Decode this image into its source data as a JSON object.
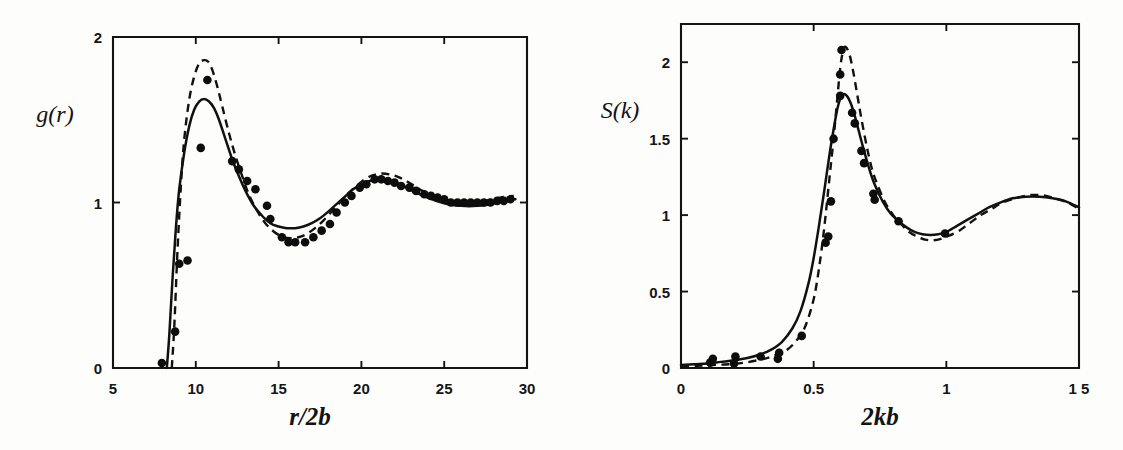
{
  "figure": {
    "background_color": "#fdfdfc",
    "ink_color": "#111111",
    "panels": [
      "left",
      "right"
    ]
  },
  "chart_data": [
    {
      "id": "left",
      "type": "line",
      "title": "",
      "xlabel": "r/2b",
      "ylabel": "g(r)",
      "xlim": [
        5,
        30
      ],
      "ylim": [
        0,
        2
      ],
      "xticks": [
        5,
        10,
        15,
        20,
        25,
        30
      ],
      "xtick_labels": [
        "5",
        "10",
        "15",
        "20",
        "25",
        "30"
      ],
      "yticks": [
        0,
        1,
        2
      ],
      "ytick_labels": [
        "0",
        "1",
        "2"
      ],
      "grid": false,
      "legend": "none",
      "series": [
        {
          "name": "solid curve",
          "style": "solid",
          "x": [
            8.25,
            8.4,
            8.6,
            8.8,
            9.0,
            9.3,
            9.6,
            9.9,
            10.2,
            10.5,
            10.8,
            11.1,
            11.4,
            11.8,
            12.2,
            12.6,
            13.0,
            13.5,
            14.0,
            14.5,
            15.0,
            15.5,
            16.0,
            16.5,
            17.0,
            17.5,
            18.0,
            18.5,
            19.0,
            19.5,
            20.0,
            20.5,
            21.0,
            21.5,
            22.0,
            22.5,
            23.0,
            23.5,
            24.0,
            24.5,
            25.0,
            25.5,
            26.0,
            26.5,
            27.0,
            27.5,
            28.0,
            28.5,
            29.0,
            29.3
          ],
          "y": [
            0.0,
            0.2,
            0.55,
            0.85,
            1.08,
            1.3,
            1.46,
            1.56,
            1.61,
            1.625,
            1.61,
            1.57,
            1.5,
            1.38,
            1.26,
            1.16,
            1.07,
            0.98,
            0.92,
            0.875,
            0.855,
            0.845,
            0.845,
            0.855,
            0.875,
            0.905,
            0.945,
            0.99,
            1.035,
            1.08,
            1.11,
            1.13,
            1.14,
            1.135,
            1.12,
            1.1,
            1.075,
            1.05,
            1.03,
            1.01,
            0.995,
            0.985,
            0.98,
            0.978,
            0.98,
            0.985,
            0.995,
            1.005,
            1.015,
            1.02
          ]
        },
        {
          "name": "dashed curve",
          "style": "dashed",
          "x": [
            8.55,
            8.7,
            8.9,
            9.1,
            9.3,
            9.6,
            9.9,
            10.2,
            10.5,
            10.75,
            11.0,
            11.3,
            11.6,
            12.0,
            12.4,
            12.8,
            13.2,
            13.7,
            14.2,
            14.7,
            15.2,
            15.7,
            16.2,
            16.7,
            17.2,
            17.7,
            18.2,
            18.7,
            19.2,
            19.7,
            20.2,
            20.7,
            21.2,
            21.7,
            22.2,
            22.7,
            23.2,
            23.7,
            24.2,
            24.7,
            25.2,
            25.7,
            26.2,
            26.7,
            27.2,
            27.7,
            28.2,
            28.7,
            29.2
          ],
          "y": [
            0.0,
            0.25,
            0.72,
            1.1,
            1.38,
            1.62,
            1.76,
            1.84,
            1.86,
            1.85,
            1.8,
            1.7,
            1.58,
            1.42,
            1.28,
            1.16,
            1.05,
            0.95,
            0.875,
            0.825,
            0.795,
            0.785,
            0.79,
            0.81,
            0.845,
            0.89,
            0.945,
            1.0,
            1.055,
            1.1,
            1.14,
            1.165,
            1.175,
            1.17,
            1.155,
            1.13,
            1.1,
            1.07,
            1.045,
            1.025,
            1.008,
            0.998,
            0.995,
            0.998,
            1.005,
            1.015,
            1.025,
            1.035,
            1.04
          ]
        }
      ],
      "points": {
        "name": "simulation data",
        "marker": "filled-circle",
        "x": [
          7.95,
          8.75,
          9.0,
          9.5,
          10.3,
          10.7,
          12.2,
          12.6,
          13.1,
          13.6,
          14.3,
          14.5,
          15.2,
          15.6,
          16.0,
          16.6,
          17.1,
          17.6,
          18.1,
          18.5,
          19.0,
          19.4,
          19.9,
          20.3,
          20.8,
          21.2,
          21.6,
          22.0,
          22.4,
          22.9,
          23.3,
          23.8,
          24.2,
          24.6,
          25.0,
          25.4,
          25.8,
          26.2,
          26.6,
          27.0,
          27.4,
          27.8,
          28.2,
          28.6,
          29.0
        ],
        "y": [
          0.03,
          0.22,
          0.63,
          0.65,
          1.33,
          1.74,
          1.25,
          1.2,
          1.13,
          1.08,
          0.98,
          0.9,
          0.79,
          0.76,
          0.76,
          0.76,
          0.79,
          0.83,
          0.87,
          0.94,
          1.0,
          1.04,
          1.09,
          1.11,
          1.14,
          1.14,
          1.13,
          1.12,
          1.1,
          1.09,
          1.07,
          1.05,
          1.04,
          1.03,
          1.02,
          1.0,
          1.0,
          1.0,
          1.0,
          1.0,
          1.0,
          1.0,
          1.01,
          1.01,
          1.02
        ]
      }
    },
    {
      "id": "right",
      "type": "line",
      "title": "",
      "xlabel": "2kb",
      "ylabel": "S(k)",
      "xlim": [
        0,
        1.5
      ],
      "ylim": [
        0,
        2.25
      ],
      "xticks": [
        0,
        0.5,
        1,
        1.5
      ],
      "xtick_labels": [
        "0",
        "0.5",
        "1",
        "1 5"
      ],
      "yticks": [
        0,
        0.5,
        1,
        1.5,
        2
      ],
      "ytick_labels": [
        "0",
        "0.5",
        "1",
        "1.5",
        "2"
      ],
      "grid": false,
      "legend": "none",
      "series": [
        {
          "name": "solid curve",
          "style": "solid",
          "x": [
            0.0,
            0.05,
            0.1,
            0.15,
            0.2,
            0.25,
            0.3,
            0.34,
            0.38,
            0.42,
            0.45,
            0.48,
            0.5,
            0.52,
            0.54,
            0.56,
            0.575,
            0.59,
            0.6,
            0.61,
            0.625,
            0.64,
            0.655,
            0.67,
            0.69,
            0.71,
            0.73,
            0.76,
            0.79,
            0.82,
            0.85,
            0.88,
            0.91,
            0.94,
            0.97,
            1.0,
            1.04,
            1.08,
            1.12,
            1.16,
            1.2,
            1.25,
            1.3,
            1.35,
            1.4,
            1.45,
            1.5
          ],
          "y": [
            0.02,
            0.025,
            0.03,
            0.04,
            0.05,
            0.065,
            0.09,
            0.12,
            0.17,
            0.26,
            0.37,
            0.55,
            0.72,
            0.93,
            1.16,
            1.4,
            1.56,
            1.7,
            1.76,
            1.79,
            1.78,
            1.73,
            1.65,
            1.55,
            1.42,
            1.3,
            1.2,
            1.09,
            1.01,
            0.96,
            0.92,
            0.89,
            0.875,
            0.87,
            0.875,
            0.89,
            0.93,
            0.97,
            1.01,
            1.05,
            1.08,
            1.11,
            1.12,
            1.12,
            1.11,
            1.09,
            1.05
          ]
        },
        {
          "name": "dashed curve",
          "style": "dashed",
          "x": [
            0.0,
            0.06,
            0.12,
            0.18,
            0.24,
            0.3,
            0.35,
            0.4,
            0.44,
            0.47,
            0.5,
            0.52,
            0.54,
            0.56,
            0.575,
            0.59,
            0.6,
            0.61,
            0.62,
            0.635,
            0.65,
            0.665,
            0.68,
            0.7,
            0.72,
            0.74,
            0.77,
            0.8,
            0.83,
            0.86,
            0.89,
            0.92,
            0.95,
            0.98,
            1.01,
            1.05,
            1.09,
            1.13,
            1.17,
            1.21,
            1.26,
            1.31,
            1.36,
            1.41,
            1.46,
            1.5
          ],
          "y": [
            0.01,
            0.015,
            0.02,
            0.025,
            0.035,
            0.055,
            0.08,
            0.12,
            0.19,
            0.28,
            0.45,
            0.65,
            0.92,
            1.25,
            1.5,
            1.78,
            1.96,
            2.07,
            2.1,
            2.05,
            1.93,
            1.78,
            1.63,
            1.45,
            1.3,
            1.2,
            1.08,
            1.0,
            0.94,
            0.89,
            0.86,
            0.84,
            0.835,
            0.845,
            0.865,
            0.9,
            0.95,
            1.0,
            1.04,
            1.08,
            1.11,
            1.13,
            1.13,
            1.11,
            1.08,
            1.04
          ]
        }
      ],
      "points": {
        "name": "simulation data",
        "marker": "filled-circle",
        "x": [
          0.11,
          0.12,
          0.2,
          0.205,
          0.3,
          0.365,
          0.37,
          0.455,
          0.545,
          0.555,
          0.565,
          0.575,
          0.6,
          0.6,
          0.605,
          0.645,
          0.655,
          0.68,
          0.69,
          0.725,
          0.73,
          0.82,
          0.995
        ],
        "y": [
          0.035,
          0.06,
          0.03,
          0.075,
          0.075,
          0.06,
          0.1,
          0.21,
          0.82,
          0.86,
          1.09,
          1.5,
          1.78,
          1.92,
          2.08,
          1.67,
          1.6,
          1.42,
          1.34,
          1.14,
          1.1,
          0.96,
          0.88
        ]
      }
    }
  ],
  "left_panel": {
    "y_axis_label": "g(r)",
    "x_axis_label": "r/2b",
    "x_tick_labels": [
      "5",
      "10",
      "15",
      "20",
      "25",
      "30"
    ],
    "y_tick_labels": [
      "0",
      "1",
      "2"
    ]
  },
  "right_panel": {
    "y_axis_label": "S(k)",
    "x_axis_label": "2kb",
    "x_tick_labels": [
      "0",
      "0.5",
      "1",
      "1 5"
    ],
    "y_tick_labels": [
      "0",
      "0.5",
      "1",
      "1.5",
      "2"
    ]
  }
}
